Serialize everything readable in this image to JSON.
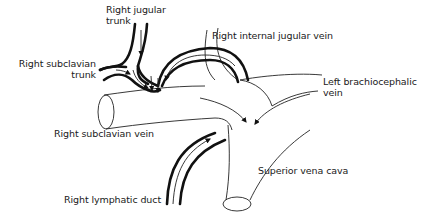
{
  "figure": {
    "labels": {
      "right_jugular_trunk": [
        "Right jugular",
        "trunk"
      ],
      "right_subclavian_trunk": [
        "Right subclavian",
        "trunk"
      ],
      "right_internal_jugular_vein": "Right internal jugular vein",
      "left_brachiocephalic_vein": [
        "Left brachiocephalic",
        "vein"
      ],
      "right_subclavian_vein": "Right subclavian vein",
      "superior_vena_cava": "Superior vena cava",
      "right_lymphatic_duct": "Right lymphatic duct"
    },
    "colors": {
      "ink": "#111111",
      "background": "#ffffff"
    }
  }
}
